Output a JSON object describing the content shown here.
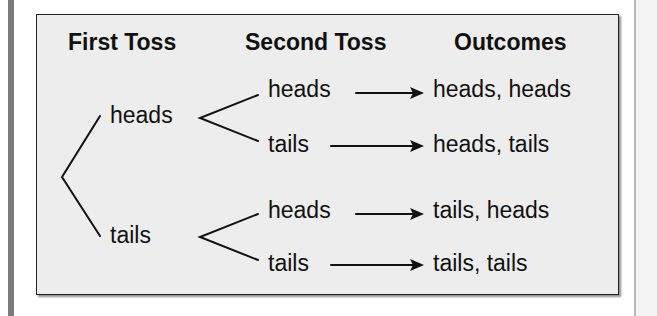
{
  "diagram": {
    "headers": {
      "first_toss": "First Toss",
      "second_toss": "Second Toss",
      "outcomes": "Outcomes"
    },
    "first_toss": [
      {
        "label": "heads"
      },
      {
        "label": "tails"
      }
    ],
    "second_toss": [
      {
        "label": "heads"
      },
      {
        "label": "tails"
      },
      {
        "label": "heads"
      },
      {
        "label": "tails"
      }
    ],
    "outcomes": [
      {
        "label": "heads, heads"
      },
      {
        "label": "heads, tails"
      },
      {
        "label": "tails, heads"
      },
      {
        "label": "tails, tails"
      }
    ],
    "colors": {
      "box_background": "#ededed",
      "border": "#222222",
      "text": "#111111",
      "left_rule": "#7a7a7a"
    }
  }
}
